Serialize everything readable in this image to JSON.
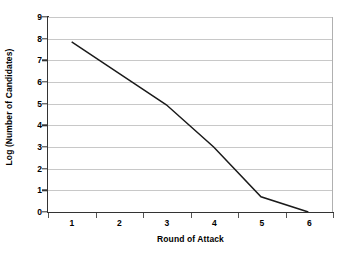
{
  "chart_data": {
    "type": "line",
    "title": "",
    "xlabel": "Round of Attack",
    "ylabel": "Log (Number of Candidates)",
    "categories": [
      "1",
      "2",
      "3",
      "4",
      "5",
      "6"
    ],
    "x": [
      1,
      2,
      3,
      4,
      5,
      6
    ],
    "values": [
      7.85,
      6.4,
      4.95,
      3.0,
      0.7,
      0.0
    ],
    "series": [
      {
        "name": "Log (Number of Candidates)",
        "values": [
          7.85,
          6.4,
          4.95,
          3.0,
          0.7,
          0.0
        ],
        "color": "#1a1a1a"
      }
    ],
    "ylim": [
      0,
      9
    ],
    "xlim": [
      0.5,
      6.5
    ],
    "yticks": [
      0,
      1,
      2,
      3,
      4,
      5,
      6,
      7,
      8,
      9
    ],
    "ytick_labels": [
      "0",
      "1",
      "2",
      "3",
      "4",
      "5",
      "6",
      "7",
      "8",
      "9"
    ],
    "xtick_labels": [
      "1",
      "2",
      "3",
      "4",
      "5",
      "6"
    ],
    "grid": "horizontal",
    "legend": "none",
    "markers": "none",
    "annotations": []
  },
  "axes": {
    "y_title": "Log (Number of Candidates)",
    "x_title": "Round of Attack"
  },
  "colors": {
    "background": "#ffffff",
    "gridline": "#c8c8c8",
    "axis": "#333333",
    "series": "#1a1a1a",
    "plot_border": "#b0b0b0"
  }
}
